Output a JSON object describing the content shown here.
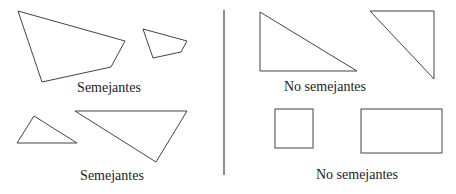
{
  "labels": {
    "top_left": "Semejantes",
    "bottom_left": "Semejantes",
    "top_right": "No semejantes",
    "bottom_right": "No semejantes"
  },
  "colors": {
    "stroke": "#444444",
    "divider": "#666666"
  }
}
